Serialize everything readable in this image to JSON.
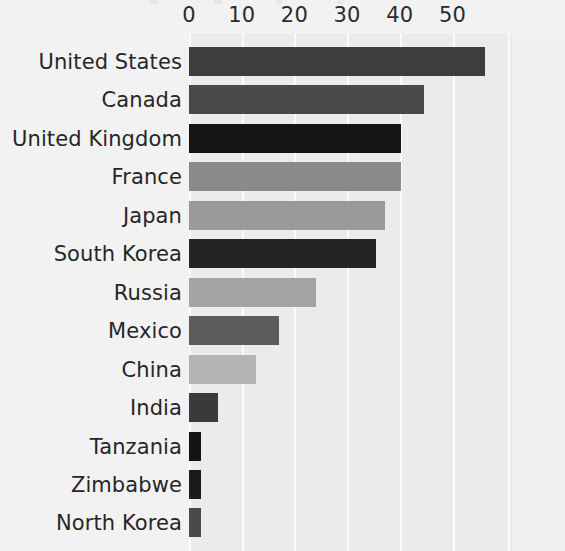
{
  "chart_data": {
    "type": "bar",
    "orientation": "horizontal",
    "title": "",
    "xlabel": "",
    "ylabel": "",
    "xlim": [
      0,
      61
    ],
    "grid": true,
    "grid_axis": "x",
    "legend": "none",
    "xticks": [
      0,
      10,
      20,
      30,
      40,
      50
    ],
    "xtick_labels": [
      "0",
      "10",
      "20",
      "30",
      "40",
      "50"
    ],
    "axis_position": "top",
    "categories": [
      "United States",
      "Canada",
      "United Kingdom",
      "France",
      "Japan",
      "South Korea",
      "Russia",
      "Mexico",
      "China",
      "India",
      "Tanzania",
      "Zimbabwe",
      "North Korea"
    ],
    "values": [
      56.2,
      44.6,
      40.2,
      40.2,
      37.2,
      35.5,
      24.1,
      17.1,
      12.7,
      5.5,
      2.3,
      2.3,
      2.3
    ],
    "bar_colors": [
      "#3d3d3d",
      "#494949",
      "#151515",
      "#8a8a8a",
      "#9a9a9a",
      "#242424",
      "#a3a3a3",
      "#5c5c5c",
      "#b4b4b4",
      "#3a3a3a",
      "#141414",
      "#1b1b1b",
      "#4a4a4a"
    ]
  },
  "style": {
    "figure_background": "#f2f2f2",
    "plot_background": "#eaebeb",
    "gridline_color": "#fbfbfb",
    "tick_label_color": "#2b2b2b",
    "category_label_color": "#262626"
  }
}
